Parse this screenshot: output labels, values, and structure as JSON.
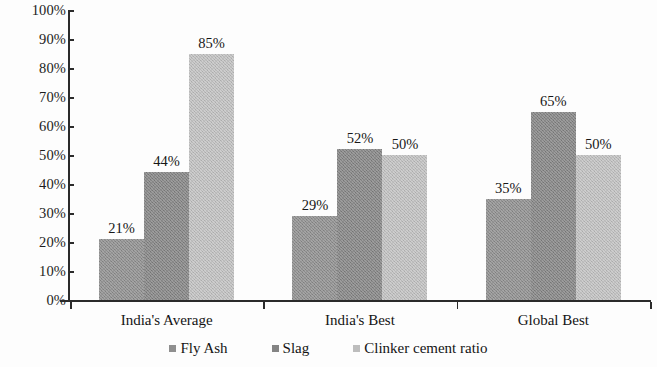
{
  "chart_data": {
    "type": "bar",
    "title": "",
    "subtitle": "",
    "xlabel": "",
    "ylabel": "",
    "categories": [
      "India's Average",
      "India's Best",
      "Global Best"
    ],
    "series": [
      {
        "name": "Fly Ash",
        "color": "#8f8f8f",
        "values": [
          21,
          44,
          35
        ],
        "labels": [
          "21%",
          "44%",
          "35%"
        ]
      },
      {
        "name": "Slag",
        "color": "#848484",
        "values": [
          29,
          52,
          65
        ],
        "labels": [
          "29%",
          "52%",
          "65%"
        ]
      },
      {
        "name": "Clinker cement ratio",
        "color": "#c2c2c2",
        "values": [
          85,
          50,
          50
        ],
        "labels": [
          "85%",
          "50%",
          "50%"
        ]
      }
    ],
    "grouped_values": [
      {
        "category": "India's Average",
        "bars": [
          {
            "series": "Fly Ash",
            "value": 21,
            "label": "21%"
          },
          {
            "series": "Slag",
            "value": 44,
            "label": "44%"
          },
          {
            "series": "Clinker cement ratio",
            "value": 85,
            "label": "85%"
          }
        ]
      },
      {
        "category": "India's Best",
        "bars": [
          {
            "series": "Fly Ash",
            "value": 29,
            "label": "29%"
          },
          {
            "series": "Slag",
            "value": 52,
            "label": "52%"
          },
          {
            "series": "Clinker cement ratio",
            "value": 50,
            "label": "50%"
          }
        ]
      },
      {
        "category": "Global Best",
        "bars": [
          {
            "series": "Fly Ash",
            "value": 35,
            "label": "35%"
          },
          {
            "series": "Slag",
            "value": 65,
            "label": "65%"
          },
          {
            "series": "Clinker cement ratio",
            "value": 50,
            "label": "50%"
          }
        ]
      }
    ],
    "ylim": [
      0,
      100
    ],
    "ytick_labels": [
      "0%",
      "10%",
      "20%",
      "30%",
      "40%",
      "50%",
      "60%",
      "70%",
      "80%",
      "90%",
      "100%"
    ],
    "ytick_values": [
      0,
      10,
      20,
      30,
      40,
      50,
      60,
      70,
      80,
      90,
      100
    ],
    "grid": false,
    "legend_position": "bottom",
    "legend_entries": [
      "Fly Ash",
      "Slag",
      "Clinker cement ratio"
    ]
  },
  "axis": {
    "line_color": "#2b2b2b"
  }
}
